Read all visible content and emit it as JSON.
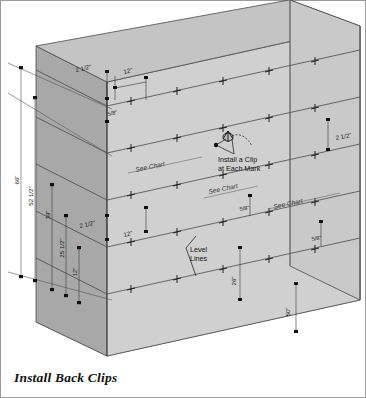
{
  "figure": {
    "caption": "Install Back Clips",
    "type": "isometric-assembly-diagram"
  },
  "colors": {
    "face_front": "#d0d0d0",
    "face_left": "#a8a8a8",
    "face_top": "#c4c4c4",
    "face_right": "#c9c9c9",
    "face_floor": "#ededed",
    "outline": "#4a4a4a",
    "dim_line": "#555555",
    "level_line": "#4a4a4a",
    "text": "#1a1a1a",
    "frame_border": "#9a9a9a",
    "background": "#ffffff"
  },
  "dimensions": {
    "left_chain": [
      {
        "label": "66\"",
        "name": "overall-height"
      },
      {
        "label": "52 1/2\"",
        "name": "second-height"
      },
      {
        "label": "39\"",
        "name": "third-height"
      },
      {
        "label": "25 1/2\"",
        "name": "fourth-height"
      },
      {
        "label": "12\"",
        "name": "fifth-height"
      }
    ],
    "top_left": [
      {
        "label": "2 1/2\"",
        "name": "top-offset"
      },
      {
        "label": "5/8\"",
        "name": "clip-gap-upper"
      },
      {
        "label": "12\"",
        "name": "top-spacing"
      }
    ],
    "mid_left": [
      {
        "label": "2 1/2\"",
        "name": "mid-offset"
      },
      {
        "label": "12\"",
        "name": "mid-spacing"
      }
    ],
    "right_side": [
      {
        "label": "2 1/2\"",
        "name": "right-top-offset"
      },
      {
        "label": "5/8\"",
        "name": "right-clip-gap-upper"
      },
      {
        "label": "5/8\"",
        "name": "right-clip-gap-lower"
      },
      {
        "label": "50\"",
        "name": "right-lower-height"
      }
    ],
    "interior": [
      {
        "label": "26\"",
        "name": "interior-height"
      }
    ]
  },
  "annotations": {
    "clip_note_line1": "Install a Clip",
    "clip_note_line2": "at Each Mark",
    "level_lines_line1": "Level",
    "level_lines_line2": "Lines",
    "see_chart": "See Chart",
    "see_chart_count": 3
  },
  "level_lines": {
    "count": 5,
    "mark_glyph": "+",
    "description": "horizontal level lines across the front face with cross marks indicating clip positions"
  }
}
